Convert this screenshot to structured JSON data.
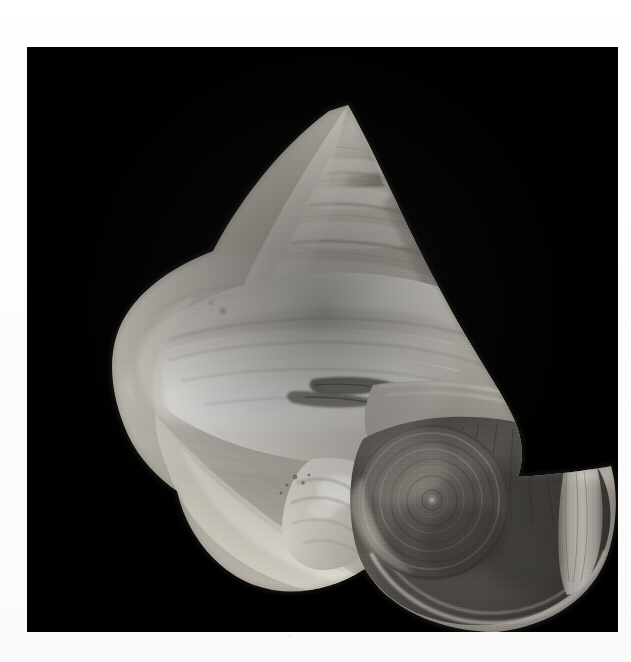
{
  "page": {
    "background_color": "#fdfdfc",
    "width": 631,
    "height": 662
  },
  "plate": {
    "name": "shell-photograph",
    "background_color": "#000000",
    "left": 27,
    "top": 47,
    "width": 591,
    "height": 585,
    "caption": ""
  },
  "subject": {
    "kind": "gastropod-shell",
    "orientation": "apex-upper-right, aperture-lower-right, tilted",
    "description": "Conical turbinate sea snail shell photographed in greyscale against a black ground, apex at top, umbilicus and aperture at lower right.",
    "tone_range": {
      "highlight": "#f2f0ec",
      "midtone": "#b9b4ac",
      "shadow": "#5d5a54",
      "deep_shadow": "#2e2c29",
      "ground": "#000000"
    },
    "features": [
      {
        "id": "apex",
        "label": "apex"
      },
      {
        "id": "spire-whorls",
        "label": "spire whorls"
      },
      {
        "id": "suture-bands",
        "label": "suture bands"
      },
      {
        "id": "body-whorl",
        "label": "body whorl"
      },
      {
        "id": "periphery-keel",
        "label": "peripheral keel"
      },
      {
        "id": "aperture",
        "label": "aperture"
      },
      {
        "id": "umbilicus",
        "label": "umbilicus"
      },
      {
        "id": "columella",
        "label": "columellar callus"
      },
      {
        "id": "chipped-edge",
        "label": "chipped lip"
      },
      {
        "id": "outer-lip",
        "label": "outer lip highlight"
      }
    ],
    "whorl_count": 6
  }
}
